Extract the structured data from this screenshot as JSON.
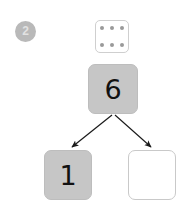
{
  "worksheet": {
    "question_number": "2",
    "dice": {
      "name": "six-dot-tile",
      "dot_count": 6,
      "rows": [
        [
          "dot",
          "dot",
          "dot"
        ],
        [
          "dot",
          "dot",
          "dot"
        ]
      ]
    },
    "number_bond": {
      "total": {
        "label": "6",
        "state": "filled"
      },
      "parts": [
        {
          "label": "1",
          "state": "filled"
        },
        {
          "label": "",
          "state": "empty"
        }
      ],
      "arrows": [
        {
          "name": "arrow-to-left-part",
          "from": [
            113,
            114
          ],
          "to": [
            71,
            147
          ]
        },
        {
          "name": "arrow-to-right-part",
          "from": [
            113,
            114
          ],
          "to": [
            152,
            147
          ]
        }
      ]
    },
    "colors": {
      "box_fill": "#c6c6c6",
      "box_border": "#c9c9c9",
      "badge_fill": "#b9b9b9",
      "badge_text": "#e2e2e2",
      "dot_fill": "#9a9a9a",
      "digit": "#111111",
      "arrow": "#1a1a1a",
      "page_background": "#ffffff"
    }
  }
}
